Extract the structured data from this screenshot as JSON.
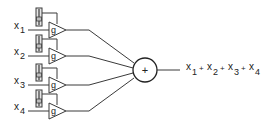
{
  "diagram": {
    "colors": {
      "stroke": "#3a3a3a",
      "slider_fill": "#bdbdbd",
      "background": "#ffffff"
    },
    "inputs": [
      {
        "var": "x",
        "sub": "1",
        "gain": "g",
        "y": 30
      },
      {
        "var": "x",
        "sub": "2",
        "gain": "g",
        "y": 56
      },
      {
        "var": "x",
        "sub": "3",
        "gain": "g",
        "y": 85
      },
      {
        "var": "x",
        "sub": "4",
        "gain": "g",
        "y": 111
      }
    ],
    "summer": {
      "symbol": "+",
      "cx": 145,
      "cy": 70,
      "r": 12
    },
    "output": {
      "terms": [
        {
          "var": "x",
          "sub": "1"
        },
        {
          "var": "x",
          "sub": "2"
        },
        {
          "var": "x",
          "sub": "3"
        },
        {
          "var": "x",
          "sub": "4"
        }
      ],
      "operator": "+"
    }
  }
}
